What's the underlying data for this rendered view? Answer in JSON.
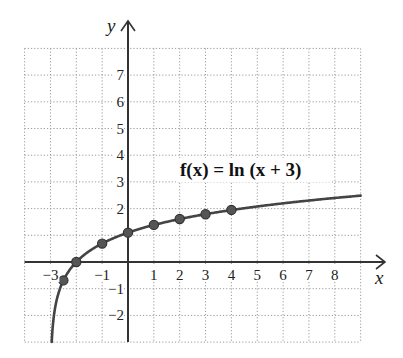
{
  "chart_data": {
    "type": "line",
    "title": "",
    "annotation": "f(x) = ln (x + 3)",
    "function": "ln(x + 3)",
    "xlabel": "x",
    "ylabel": "y",
    "xlim": [
      -4,
      9
    ],
    "ylim": [
      -3,
      8
    ],
    "grid": true,
    "grid_style": "dotted",
    "x_ticks": [
      -3,
      -2,
      -1,
      0,
      1,
      2,
      3,
      4,
      5,
      6,
      7,
      8
    ],
    "x_tick_labels": [
      {
        "value": -3,
        "label": "−3"
      },
      {
        "value": -1,
        "label": "−1"
      },
      {
        "value": 1,
        "label": "1"
      },
      {
        "value": 2,
        "label": "2"
      },
      {
        "value": 3,
        "label": "3"
      },
      {
        "value": 4,
        "label": "4"
      },
      {
        "value": 5,
        "label": "5"
      },
      {
        "value": 6,
        "label": "6"
      },
      {
        "value": 7,
        "label": "7"
      },
      {
        "value": 8,
        "label": "8"
      }
    ],
    "y_tick_labels": [
      {
        "value": 7,
        "label": "7"
      },
      {
        "value": 6,
        "label": "6"
      },
      {
        "value": 5,
        "label": "5"
      },
      {
        "value": 4,
        "label": "4"
      },
      {
        "value": 3,
        "label": "3"
      },
      {
        "value": 2,
        "label": "2"
      },
      {
        "value": -1,
        "label": "−1"
      },
      {
        "value": -2,
        "label": "−2"
      }
    ],
    "series": [
      {
        "name": "f(x) = ln (x + 3)",
        "curve_domain": [
          -2.95,
          9
        ],
        "points": [
          {
            "x": -2.5,
            "y": -0.69
          },
          {
            "x": -2,
            "y": 0
          },
          {
            "x": -1,
            "y": 0.69
          },
          {
            "x": 0,
            "y": 1.1
          },
          {
            "x": 1,
            "y": 1.39
          },
          {
            "x": 2,
            "y": 1.61
          },
          {
            "x": 3,
            "y": 1.79
          },
          {
            "x": 4,
            "y": 1.95
          }
        ]
      }
    ],
    "colors": {
      "curve": "#444444",
      "points_fill": "#555555",
      "points_stroke": "#333333",
      "axis": "#333333",
      "grid": "#9a9a9a"
    }
  }
}
